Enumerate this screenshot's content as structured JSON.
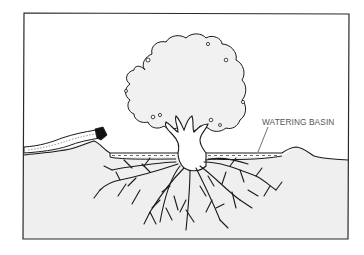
{
  "figure": {
    "labels": {
      "watering_basin": "WATERING BASIN"
    },
    "colors": {
      "background": "#ffffff",
      "line": "#1a1a1a",
      "soil_fill": "#efefef",
      "canopy_fill": "#f1f1f1",
      "label_text": "#555555"
    }
  }
}
